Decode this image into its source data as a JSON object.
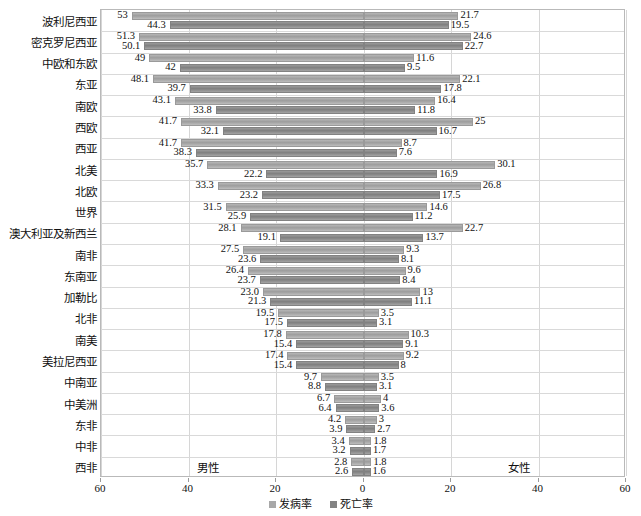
{
  "chart_data": {
    "type": "bar",
    "subtype": "diverging-butterfly",
    "title": "",
    "xlabel": "",
    "ylabel": "",
    "xlim": [
      -60,
      60
    ],
    "xticks": [
      "60",
      "40",
      "20",
      "0",
      "20",
      "40",
      "60"
    ],
    "xtick_values": [
      -60,
      -40,
      -20,
      0,
      20,
      40,
      60
    ],
    "grid": true,
    "legend_position": "bottom",
    "side_labels": {
      "left": "男性",
      "right": "女性"
    },
    "legend": [
      {
        "key": "incidence",
        "label": "发病率",
        "color": "#a8a8a8"
      },
      {
        "key": "mortality",
        "label": "死亡率",
        "color": "#838383"
      }
    ],
    "categories": [
      "波利尼西亚",
      "密克罗尼西亚",
      "中欧和东欧",
      "东亚",
      "南欧",
      "西欧",
      "西亚",
      "北美",
      "北欧",
      "世界",
      "澳大利亚及新西兰",
      "南非",
      "东南亚",
      "加勒比",
      "北非",
      "南美",
      "美拉尼西亚",
      "中南亚",
      "中美洲",
      "东非",
      "中非",
      "西非"
    ],
    "series": [
      {
        "name": "男性发病率",
        "side": "left",
        "key": "male_incidence",
        "values": [
          53,
          51.3,
          49,
          48.1,
          43.1,
          41.7,
          41.7,
          35.7,
          33.3,
          31.5,
          28.1,
          27.5,
          26.4,
          23.0,
          19.5,
          17.8,
          17.4,
          9.7,
          6.7,
          4.2,
          3.4,
          2.8
        ],
        "labels": [
          "53",
          "51.3",
          "49",
          "48.1",
          "43.1",
          "41.7",
          "41.7",
          "35.7",
          "33.3",
          "31.5",
          "28.1",
          "27.5",
          "26.4",
          "23.0",
          "19.5",
          "17.8",
          "17.4",
          "9.7",
          "6.7",
          "4.2",
          "3.4",
          "2.8"
        ]
      },
      {
        "name": "男性死亡率",
        "side": "left",
        "key": "male_mortality",
        "values": [
          44.3,
          50.1,
          42,
          39.7,
          33.8,
          32.1,
          38.3,
          22.2,
          23.2,
          25.9,
          19.1,
          23.6,
          23.7,
          21.3,
          17.5,
          15.4,
          15.4,
          8.8,
          6.4,
          3.9,
          3.2,
          2.6
        ],
        "labels": [
          "44.3",
          "50.1",
          "42",
          "39.7",
          "33.8",
          "32.1",
          "38.3",
          "22.2",
          "23.2",
          "25.9",
          "19.1",
          "23.6",
          "23.7",
          "21.3",
          "17.5",
          "15.4",
          "15.4",
          "8.8",
          "6.4",
          "3.9",
          "3.2",
          "2.6"
        ]
      },
      {
        "name": "女性发病率",
        "side": "right",
        "key": "female_incidence",
        "values": [
          21.7,
          24.6,
          11.6,
          22.1,
          16.4,
          25,
          8.7,
          30.1,
          26.8,
          14.6,
          22.7,
          9.3,
          9.6,
          13,
          3.5,
          10.3,
          9.2,
          3.5,
          4,
          3,
          1.8,
          1.8
        ],
        "labels": [
          "21.7",
          "24.6",
          "11.6",
          "22.1",
          "16.4",
          "25",
          "8.7",
          "30.1",
          "26.8",
          "14.6",
          "22.7",
          "9.3",
          "9.6",
          "13",
          "3.5",
          "10.3",
          "9.2",
          "3.5",
          "4",
          "3",
          "1.8",
          "1.8"
        ]
      },
      {
        "name": "女性死亡率",
        "side": "right",
        "key": "female_mortality",
        "values": [
          19.5,
          22.7,
          9.5,
          17.8,
          11.8,
          16.7,
          7.6,
          16.9,
          17.5,
          11.2,
          13.7,
          8.1,
          8.4,
          11.1,
          3.1,
          9.1,
          8,
          3.1,
          3.6,
          2.7,
          1.7,
          1.6
        ],
        "labels": [
          "19.5",
          "22.7",
          "9.5",
          "17.8",
          "11.8",
          "16.7",
          "7.6",
          "16.9",
          "17.5",
          "11.2",
          "13.7",
          "8.1",
          "8.4",
          "11.1",
          "3.1",
          "9.1",
          "8",
          "3.1",
          "3.6",
          "2.7",
          "1.7",
          "1.6"
        ]
      }
    ]
  }
}
